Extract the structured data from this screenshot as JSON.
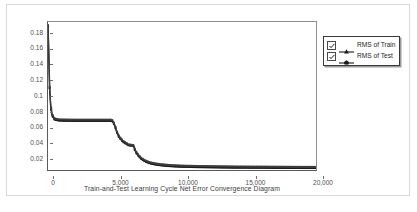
{
  "chart_data": {
    "type": "line",
    "title": "Train-and-Test Learning Cycle Net Error Convergence Diagram",
    "xlabel": "Train-and-Test Learning Cycle Net Error Convergence Diagram",
    "ylabel": "",
    "xlim": [
      0,
      20000
    ],
    "ylim": [
      0,
      0.19
    ],
    "grid": false,
    "legend_position": "top-right-outside",
    "x_ticks": [
      0,
      5000,
      10000,
      15000,
      20000
    ],
    "x_tick_labels": [
      "0",
      "5,000",
      "10,000",
      "15,000",
      "20,000"
    ],
    "y_ticks": [
      0.02,
      0.04,
      0.06,
      0.08,
      0.1,
      0.12,
      0.14,
      0.16,
      0.18
    ],
    "y_tick_labels": [
      "0.02",
      "0.04",
      "0.06",
      "0.08",
      "0.1",
      "0.12",
      "0.14",
      "0.16",
      "0.18"
    ],
    "series": [
      {
        "name": "RMS of Train",
        "color": "#1a1a1a",
        "marker": "square",
        "x": [
          0,
          60,
          120,
          200,
          300,
          500,
          800,
          1200,
          1600,
          2000,
          2400,
          2800,
          3200,
          3600,
          4000,
          4400,
          4700,
          4800,
          4900,
          5000,
          5100,
          5300,
          5600,
          6000,
          6200,
          6350,
          6400,
          6450,
          6600,
          6800,
          7000,
          7300,
          7600,
          8000,
          8400,
          8800,
          9200,
          9600,
          10000,
          11000,
          12000,
          13000,
          14000,
          15000,
          16000,
          17000,
          18000,
          19000,
          20000
        ],
        "y": [
          0.185,
          0.148,
          0.105,
          0.082,
          0.07,
          0.0645,
          0.0635,
          0.0632,
          0.0631,
          0.063,
          0.063,
          0.063,
          0.063,
          0.063,
          0.063,
          0.063,
          0.063,
          0.0625,
          0.06,
          0.056,
          0.05,
          0.042,
          0.036,
          0.0318,
          0.0312,
          0.031,
          0.03,
          0.027,
          0.0215,
          0.017,
          0.0135,
          0.0105,
          0.0085,
          0.007,
          0.006,
          0.0053,
          0.0048,
          0.0044,
          0.0041,
          0.0037,
          0.0034,
          0.0032,
          0.003,
          0.0029,
          0.0028,
          0.0027,
          0.0026,
          0.0025,
          0.0025
        ]
      },
      {
        "name": "RMS of Test",
        "color": "#3d3d3d",
        "marker": "square",
        "x": [
          0,
          60,
          120,
          200,
          300,
          500,
          800,
          1200,
          1600,
          2000,
          2400,
          2800,
          3200,
          3600,
          4000,
          4400,
          4700,
          4800,
          4900,
          5000,
          5100,
          5300,
          5600,
          6000,
          6200,
          6350,
          6400,
          6450,
          6600,
          6800,
          7000,
          7300,
          7600,
          8000,
          8400,
          8800,
          9200,
          9600,
          10000,
          11000,
          12000,
          13000,
          14000,
          15000,
          16000,
          17000,
          18000,
          19000,
          20000
        ],
        "y": [
          0.186,
          0.15,
          0.107,
          0.084,
          0.072,
          0.066,
          0.065,
          0.0648,
          0.0647,
          0.0646,
          0.0646,
          0.0646,
          0.0646,
          0.0646,
          0.0646,
          0.0646,
          0.0646,
          0.064,
          0.0615,
          0.0575,
          0.0515,
          0.0435,
          0.0375,
          0.033,
          0.0324,
          0.0322,
          0.0315,
          0.0285,
          0.023,
          0.0185,
          0.015,
          0.012,
          0.01,
          0.0085,
          0.0075,
          0.0068,
          0.0063,
          0.0059,
          0.0056,
          0.0052,
          0.0049,
          0.0047,
          0.0045,
          0.0044,
          0.0043,
          0.0042,
          0.0041,
          0.004,
          0.004
        ]
      }
    ]
  },
  "legend": {
    "items": [
      {
        "label": "RMS of Train",
        "checked": true
      },
      {
        "label": "RMS of Test",
        "checked": true
      }
    ]
  }
}
